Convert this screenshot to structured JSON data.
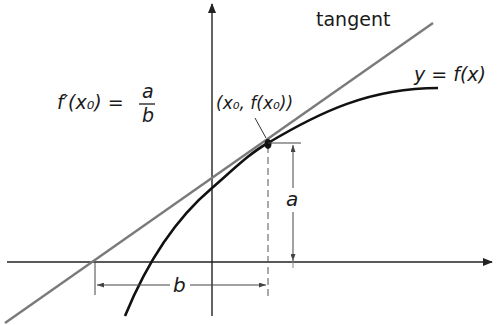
{
  "diagram": {
    "labels": {
      "tangent": "tangent",
      "curve": "y = f(x)",
      "point": "(x₀, f(x₀))",
      "formula_lhs": "f′(x₀) =",
      "formula_num": "a",
      "formula_den": "b",
      "rise": "a",
      "run": "b"
    },
    "colors": {
      "axis": "#222222",
      "curve": "#111111",
      "tangent": "#7a7a7a",
      "dimension": "#444444",
      "background": "#ffffff"
    },
    "geometry": {
      "origin": [
        212,
        262
      ],
      "tangent_point": [
        268,
        143
      ],
      "tangent_x_intercept": [
        95,
        262
      ]
    }
  }
}
